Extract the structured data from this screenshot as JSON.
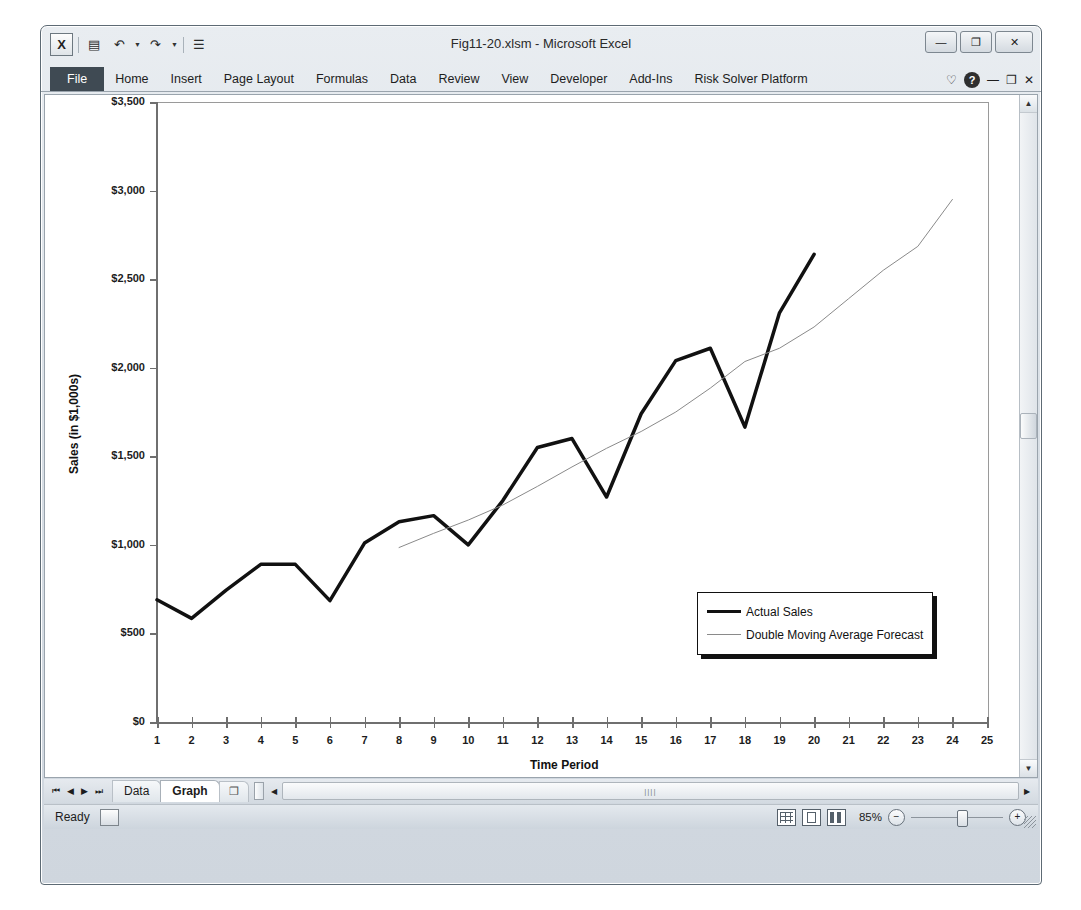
{
  "window": {
    "title": "Fig11-20.xlsm - Microsoft Excel",
    "quick_access": [
      {
        "name": "excel-logo",
        "glyph": "X"
      },
      {
        "name": "save-icon",
        "glyph": "▤"
      },
      {
        "name": "undo-icon",
        "glyph": "↶"
      },
      {
        "name": "redo-icon",
        "glyph": "↷"
      },
      {
        "name": "customize-qat-icon",
        "glyph": "☰"
      }
    ],
    "controls": [
      {
        "name": "minimize-button",
        "glyph": "—"
      },
      {
        "name": "restore-button",
        "glyph": "❐"
      },
      {
        "name": "close-button",
        "glyph": "✕"
      }
    ]
  },
  "ribbon": {
    "tabs": [
      {
        "label": "File",
        "active": true
      },
      {
        "label": "Home",
        "active": false
      },
      {
        "label": "Insert",
        "active": false
      },
      {
        "label": "Page Layout",
        "active": false
      },
      {
        "label": "Formulas",
        "active": false
      },
      {
        "label": "Data",
        "active": false
      },
      {
        "label": "Review",
        "active": false
      },
      {
        "label": "View",
        "active": false
      },
      {
        "label": "Developer",
        "active": false
      },
      {
        "label": "Add-Ins",
        "active": false
      },
      {
        "label": "Risk Solver Platform",
        "active": false
      }
    ],
    "right_icons": [
      {
        "name": "ribbon-options-icon",
        "glyph": "♡"
      },
      {
        "name": "help-icon",
        "glyph": "?"
      },
      {
        "name": "minimize-ribbon-icon",
        "glyph": "—"
      },
      {
        "name": "restore-window-icon",
        "glyph": "❐"
      },
      {
        "name": "close-window-icon",
        "glyph": "✕"
      }
    ]
  },
  "sheet_tabs": {
    "nav": [
      {
        "name": "first-sheet-button",
        "glyph": "⏮"
      },
      {
        "name": "prev-sheet-button",
        "glyph": "◀"
      },
      {
        "name": "next-sheet-button",
        "glyph": "▶"
      },
      {
        "name": "last-sheet-button",
        "glyph": "⏭"
      }
    ],
    "tabs": [
      {
        "label": "Data",
        "active": false
      },
      {
        "label": "Graph",
        "active": true
      }
    ],
    "new_sheet_glyph": "❐",
    "scroll_left_glyph": "◀",
    "scroll_right_glyph": "▶",
    "thumb_grip": "||||"
  },
  "status_bar": {
    "status": "Ready",
    "macro_record_icon": "macro-record-icon",
    "views": [
      {
        "name": "normal-view-button"
      },
      {
        "name": "page-layout-view-button"
      },
      {
        "name": "page-break-preview-button"
      }
    ],
    "zoom_level": "85%",
    "zoom_out_glyph": "−",
    "zoom_in_glyph": "+"
  },
  "chart_data": {
    "type": "line",
    "title": "",
    "xlabel": "Time Period",
    "ylabel": "Sales (in $1,000s)",
    "xlim": [
      1,
      25
    ],
    "ylim": [
      0,
      3500
    ],
    "ytick_step": 500,
    "ytick_labels": [
      "$0",
      "$500",
      "$1,000",
      "$1,500",
      "$2,000",
      "$2,500",
      "$3,000",
      "$3,500"
    ],
    "ytick_values": [
      0,
      500,
      1000,
      1500,
      2000,
      2500,
      3000,
      3500
    ],
    "xtick_labels": [
      "1",
      "2",
      "3",
      "4",
      "5",
      "6",
      "7",
      "8",
      "9",
      "10",
      "11",
      "12",
      "13",
      "14",
      "15",
      "16",
      "17",
      "18",
      "19",
      "20",
      "21",
      "22",
      "23",
      "24",
      "25"
    ],
    "grid": false,
    "legend_position": "bottom-right",
    "series": [
      {
        "name": "Actual Sales",
        "style": "thick-black",
        "color": "#111111",
        "width": 3.5,
        "x": [
          1,
          2,
          3,
          4,
          5,
          6,
          7,
          8,
          9,
          10,
          11,
          12,
          13,
          14,
          15,
          16,
          17,
          18,
          19,
          20
        ],
        "values": [
          690,
          585,
          745,
          890,
          890,
          685,
          1010,
          1130,
          1165,
          1000,
          1250,
          1550,
          1600,
          1270,
          1740,
          2040,
          2110,
          1665,
          2310,
          2640
        ]
      },
      {
        "name": "Double Moving Average Forecast",
        "style": "thin-gray",
        "color": "#8a8a8a",
        "width": 1,
        "x": [
          8,
          9,
          10,
          11,
          12,
          13,
          14,
          15,
          16,
          17,
          18,
          19,
          20,
          21,
          22,
          23,
          24
        ],
        "values": [
          985,
          1065,
          1140,
          1225,
          1330,
          1440,
          1545,
          1640,
          1750,
          1885,
          2035,
          2110,
          2230,
          2390,
          2550,
          2685,
          2950
        ]
      }
    ]
  }
}
